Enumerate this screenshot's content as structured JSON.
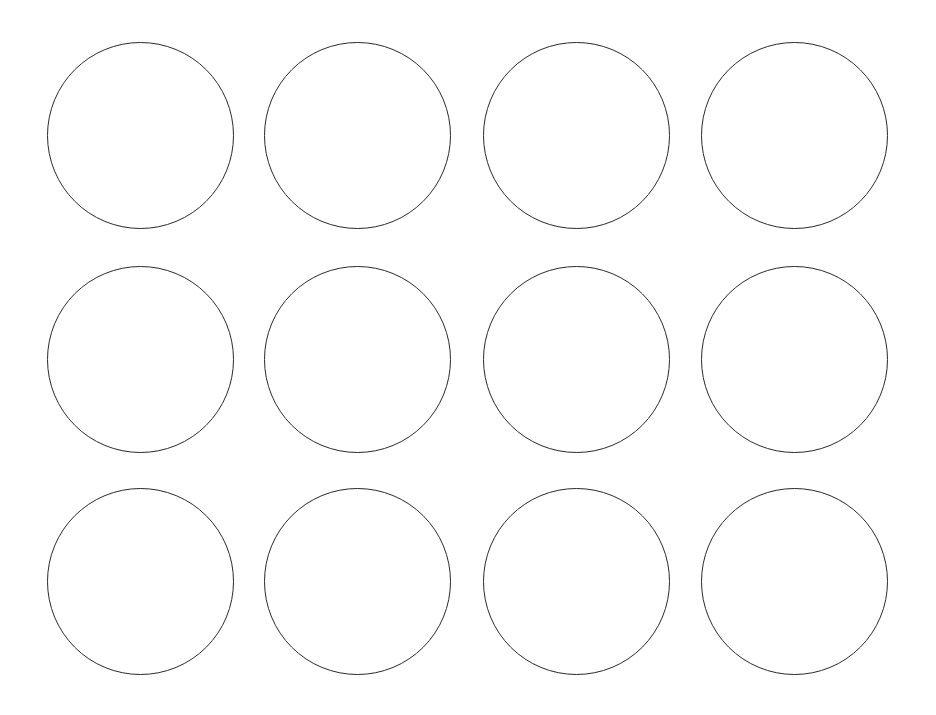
{
  "sheet": {
    "background": "#ffffff",
    "stroke_color": "#2a2a2a",
    "stroke_width": 1.6,
    "diameter": 187,
    "rows": 3,
    "columns": 4,
    "column_centers_x": [
      140,
      357,
      576,
      794
    ],
    "row_centers_y": [
      135,
      359,
      581
    ],
    "circles": [
      {
        "row": 0,
        "col": 0
      },
      {
        "row": 0,
        "col": 1
      },
      {
        "row": 0,
        "col": 2
      },
      {
        "row": 0,
        "col": 3
      },
      {
        "row": 1,
        "col": 0
      },
      {
        "row": 1,
        "col": 1
      },
      {
        "row": 1,
        "col": 2
      },
      {
        "row": 1,
        "col": 3
      },
      {
        "row": 2,
        "col": 0
      },
      {
        "row": 2,
        "col": 1
      },
      {
        "row": 2,
        "col": 2
      },
      {
        "row": 2,
        "col": 3
      }
    ]
  }
}
